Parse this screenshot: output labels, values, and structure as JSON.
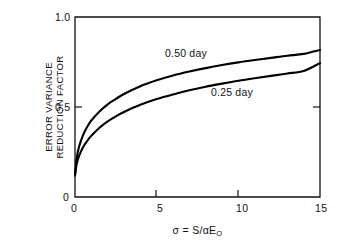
{
  "chart_data": {
    "type": "line",
    "title": "",
    "xlabel": "σ = S/αE",
    "xlabel_sub": "O",
    "ylabel_line1": "ERROR VARIANCE",
    "ylabel_line2": "REDUCTION FACTOR",
    "xlim": [
      0,
      15
    ],
    "ylim": [
      0,
      1.0
    ],
    "xticks": [
      0,
      5,
      10,
      15
    ],
    "xtick_labels": [
      "0",
      "5",
      "10",
      "15"
    ],
    "yticks": [
      0,
      0.5,
      1.0
    ],
    "ytick_labels": [
      "0",
      "0.5",
      "1.0"
    ],
    "grid": false,
    "legend_position": "inline-annotations",
    "frame": "box",
    "series": [
      {
        "name": "0.50 day",
        "label": "0.50 day",
        "color": "#000000",
        "x": [
          0.0,
          0.1,
          0.25,
          0.5,
          0.75,
          1.0,
          1.5,
          2.0,
          2.5,
          3.0,
          4.0,
          5.0,
          6.0,
          7.0,
          8.0,
          9.0,
          10.0,
          11.0,
          12.0,
          13.0,
          14.0,
          15.0
        ],
        "y": [
          0.12,
          0.215,
          0.28,
          0.345,
          0.39,
          0.425,
          0.475,
          0.515,
          0.545,
          0.572,
          0.615,
          0.648,
          0.675,
          0.697,
          0.716,
          0.733,
          0.748,
          0.761,
          0.773,
          0.785,
          0.795,
          0.817
        ]
      },
      {
        "name": "0.25 day",
        "label": "0.25 day",
        "color": "#000000",
        "x": [
          0.0,
          0.1,
          0.25,
          0.5,
          0.75,
          1.0,
          1.5,
          2.0,
          2.5,
          3.0,
          4.0,
          5.0,
          6.0,
          7.0,
          8.0,
          9.0,
          10.0,
          11.0,
          12.0,
          13.0,
          14.0,
          15.0
        ],
        "y": [
          0.12,
          0.182,
          0.228,
          0.278,
          0.312,
          0.34,
          0.385,
          0.42,
          0.448,
          0.472,
          0.512,
          0.544,
          0.57,
          0.593,
          0.613,
          0.63,
          0.646,
          0.66,
          0.673,
          0.686,
          0.7,
          0.744
        ]
      }
    ],
    "annotations": [
      {
        "text": "0.50 day",
        "x": 5.4,
        "y": 0.8
      },
      {
        "text": "0.25 day",
        "x": 9.1,
        "y": 0.6
      }
    ]
  }
}
